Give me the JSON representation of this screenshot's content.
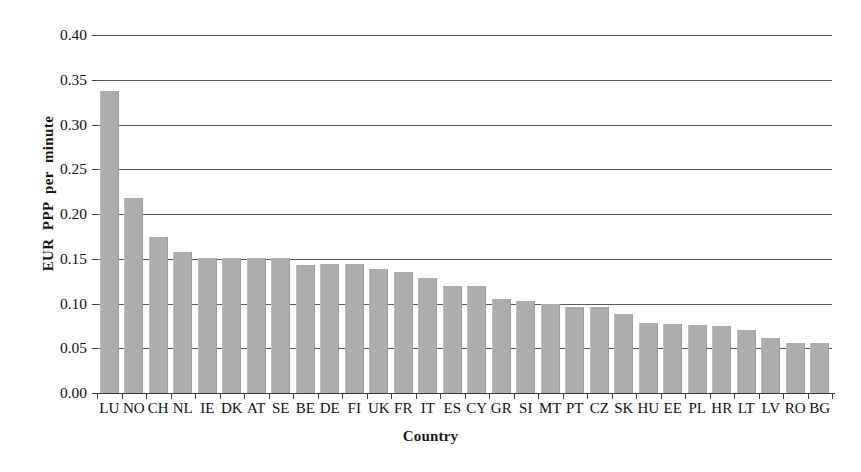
{
  "chart_data": {
    "type": "bar",
    "title": "",
    "xlabel": "Country",
    "ylabel": "EUR  PPP  per  minute",
    "ylim": [
      0.0,
      0.4
    ],
    "ytick_labels": [
      "0.40",
      "0.35",
      "0.30",
      "0.25",
      "0.20",
      "0.15",
      "0.10",
      "0.05",
      "0.00"
    ],
    "ytick_values": [
      0.4,
      0.35,
      0.3,
      0.25,
      0.2,
      0.15,
      0.1,
      0.05,
      0.0
    ],
    "grid": "horizontal",
    "legend": "none",
    "bar_color": "#adadad",
    "categories": [
      "LU",
      "NO",
      "CH",
      "NL",
      "IE",
      "DK",
      "AT",
      "SE",
      "BE",
      "DE",
      "FI",
      "UK",
      "FR",
      "IT",
      "ES",
      "CY",
      "GR",
      "SI",
      "MT",
      "PT",
      "CZ",
      "SK",
      "HU",
      "EE",
      "PL",
      "HR",
      "LT",
      "LV",
      "RO",
      "BG"
    ],
    "values": [
      0.338,
      0.218,
      0.174,
      0.158,
      0.151,
      0.151,
      0.151,
      0.151,
      0.143,
      0.144,
      0.144,
      0.139,
      0.135,
      0.129,
      0.12,
      0.12,
      0.105,
      0.103,
      0.1,
      0.096,
      0.096,
      0.088,
      0.078,
      0.077,
      0.076,
      0.075,
      0.07,
      0.061,
      0.056,
      0.056
    ]
  }
}
